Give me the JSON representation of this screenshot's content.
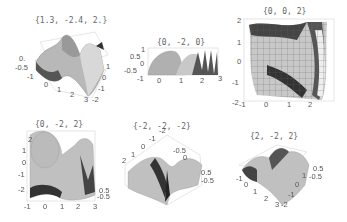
{
  "figure": {
    "panels": [
      {
        "title": "{1.3, -2.4, 2.}",
        "ticks": {
          "left": [
            "0.",
            "-0.5",
            "-1"
          ],
          "front": [
            "-1",
            "0",
            "1",
            "2",
            "3"
          ],
          "right": [
            "2",
            "1",
            "0",
            "-1",
            "-2"
          ]
        }
      },
      {
        "title": "{0, -2, 0}",
        "ticks": {
          "left": [
            "1",
            "0.5",
            "0",
            "-0.5",
            "-1"
          ],
          "bottom": [
            "-1",
            "0",
            "1",
            "2",
            "3"
          ]
        }
      },
      {
        "title": "{0, 0, 2}",
        "ticks": {
          "left": [
            "2",
            "1",
            "0",
            "-1",
            "-2"
          ],
          "bottom": [
            "-1",
            "0",
            "1",
            "2"
          ]
        }
      },
      {
        "title": "{0, -2, 2}",
        "ticks": {
          "left": [
            "2",
            "1",
            "0",
            "-1",
            "-2"
          ],
          "bottom": [
            "-1",
            "0",
            "1",
            "2",
            "3"
          ],
          "right": [
            "1",
            "0.5",
            "0",
            "-0.5"
          ]
        }
      },
      {
        "title": "{-2, -2, -2}",
        "ticks": {
          "top": [
            "-2",
            "-1",
            "0",
            "1",
            "2"
          ],
          "left": [
            "2",
            "1",
            "0",
            "-1"
          ],
          "right": [
            "1",
            "0.5",
            "0",
            "-0.5",
            "-1"
          ]
        }
      },
      {
        "title": "{2, -2, 2}",
        "ticks": {
          "left": [
            "-1",
            "0",
            "1",
            "2",
            "3"
          ],
          "right": [
            "2",
            "1",
            "0",
            "-1",
            "-2"
          ],
          "z": [
            "1",
            "0.5",
            "0",
            "-0.5"
          ]
        }
      }
    ]
  }
}
